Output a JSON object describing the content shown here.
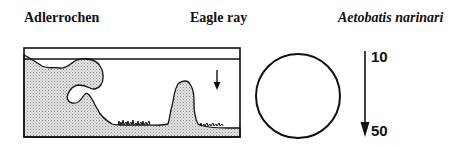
{
  "labels": {
    "german_name": "Adlerrochen",
    "english_name": "Eagle ray",
    "scientific_name": "Aetobatis narinari"
  },
  "habitat_scene": {
    "description": "reef cross-section with shaded rock/sand, water surface line and downward arrow",
    "colors": {
      "line": "#111111",
      "fill_stipple": "#c8c8c8"
    }
  },
  "size_symbol": {
    "shape": "circle"
  },
  "depth_range": {
    "top": "10",
    "bottom": "50"
  }
}
